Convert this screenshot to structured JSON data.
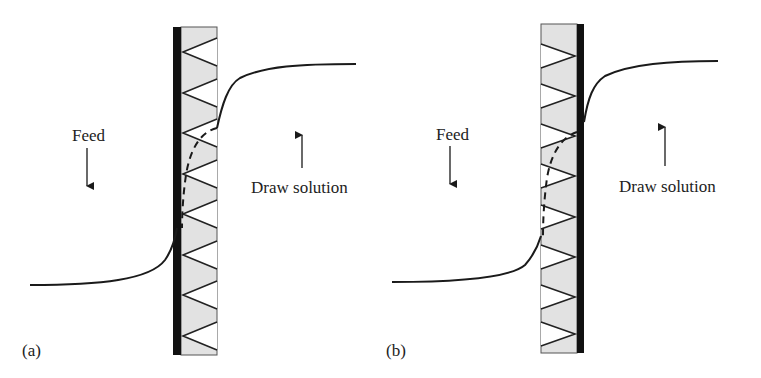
{
  "figure": {
    "colors": {
      "support": "#e2e2e2",
      "active_layer": "#111111",
      "line": "#1a1a1a",
      "background": "#ffffff"
    }
  },
  "panels": [
    {
      "id": "a",
      "label": "(a)",
      "feed_label": "Feed",
      "feed_arrow": "down",
      "draw_label": "Draw solution",
      "draw_arrow": "up",
      "active_layer_side": "left",
      "triangle_direction": "left"
    },
    {
      "id": "b",
      "label": "(b)",
      "feed_label": "Feed",
      "feed_arrow": "down",
      "draw_label": "Draw solution",
      "draw_arrow": "up",
      "active_layer_side": "right",
      "triangle_direction": "right"
    }
  ]
}
